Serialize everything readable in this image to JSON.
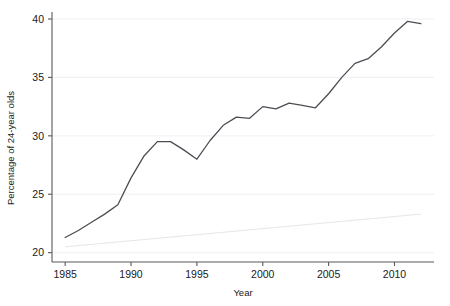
{
  "chart_data": {
    "type": "line",
    "title": "",
    "xlabel": "Year",
    "ylabel": "Percentage of 24-year olds",
    "xlim": [
      1984,
      2013
    ],
    "ylim": [
      19.2,
      40.6
    ],
    "xticks": [
      1985,
      1990,
      1995,
      2000,
      2005,
      2010
    ],
    "xtick_labels": [
      "1985",
      "1990",
      "1995",
      "2000",
      "2005",
      "2010"
    ],
    "yticks": [
      20,
      25,
      30,
      35,
      40
    ],
    "ytick_labels": [
      "20",
      "25",
      "30",
      "35",
      "40"
    ],
    "grid": "horizontal",
    "legend": "none",
    "series": [
      {
        "name": "Percentage of 24-year olds",
        "color": "#4d4d55",
        "x": [
          1985,
          1986,
          1987,
          1988,
          1989,
          1990,
          1991,
          1992,
          1993,
          1994,
          1995,
          1996,
          1997,
          1998,
          1999,
          2000,
          2001,
          2002,
          2003,
          2004,
          2005,
          2006,
          2007,
          2008,
          2009,
          2010,
          2011,
          2012
        ],
        "values": [
          21.3,
          21.9,
          22.6,
          23.3,
          24.1,
          26.4,
          28.3,
          29.5,
          29.5,
          28.8,
          28.0,
          29.6,
          30.9,
          31.6,
          31.5,
          32.5,
          32.3,
          32.8,
          32.6,
          32.4,
          33.6,
          35.0,
          36.2,
          36.6,
          37.6,
          38.8,
          39.8,
          39.6
        ]
      },
      {
        "name": "trend",
        "color": "#e6e6ec",
        "x": [
          1985,
          2012
        ],
        "values": [
          20.5,
          23.3
        ]
      }
    ]
  },
  "axis": {
    "y_title": "Percentage of 24-year olds",
    "x_title": "Year"
  }
}
